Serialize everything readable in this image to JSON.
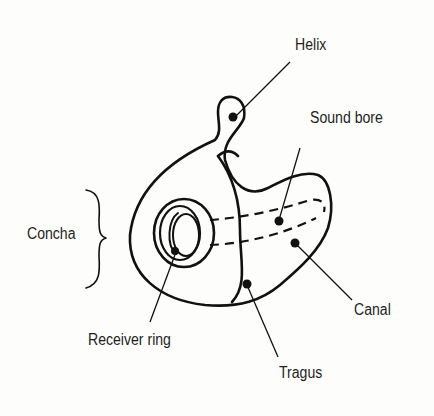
{
  "diagram": {
    "labels": {
      "helix": "Helix",
      "sound_bore": "Sound bore",
      "concha": "Concha",
      "canal": "Canal",
      "receiver_ring": "Receiver ring",
      "tragus": "Tragus"
    },
    "colors": {
      "stroke": "#111111",
      "text": "#1e1e1e",
      "background": "#fdfdfb"
    }
  }
}
